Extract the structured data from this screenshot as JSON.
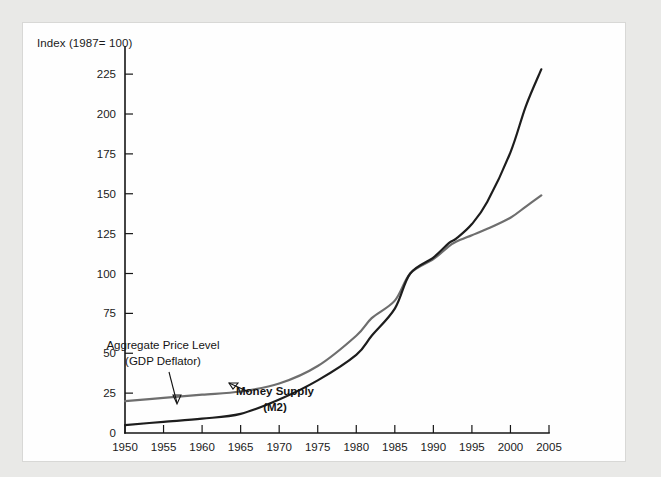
{
  "figure": {
    "title": "Index (1987= 100)",
    "panel_bg": "#fefefe",
    "outer_bg": "#e9e9e7"
  },
  "annotations": {
    "deflator": {
      "line1": "Aggregate Price Level",
      "line2": "(GDP Deflator)"
    },
    "money": {
      "line1": "Money Supply",
      "line2": "(M2)"
    }
  },
  "chart_data": {
    "type": "line",
    "title": "Index (1987= 100)",
    "xlabel": "",
    "ylabel": "Index (1987= 100)",
    "xlim": [
      1950,
      2005
    ],
    "ylim": [
      0,
      237
    ],
    "grid": false,
    "legend": "annotations-inline",
    "xticks": [
      1950,
      1955,
      1960,
      1965,
      1970,
      1975,
      1980,
      1985,
      1990,
      1995,
      2000,
      2005
    ],
    "yticks": [
      0,
      25,
      50,
      75,
      100,
      125,
      150,
      175,
      200,
      225
    ],
    "x": [
      1950,
      1955,
      1960,
      1965,
      1970,
      1975,
      1980,
      1982,
      1985,
      1987,
      1990,
      1992,
      1993,
      1995,
      1997,
      2000,
      2002,
      2004
    ],
    "series": [
      {
        "name": "Aggregate Price Level (GDP Deflator)",
        "color": "#6e6e6e",
        "width": 2.2,
        "values": [
          20,
          22,
          24,
          26,
          31,
          42,
          61,
          72,
          83,
          100,
          109,
          117,
          120,
          124,
          128,
          135,
          142,
          149
        ]
      },
      {
        "name": "Money Supply (M2)",
        "color": "#1d1d1d",
        "width": 2.2,
        "values": [
          5,
          7,
          9,
          12,
          21,
          33,
          49,
          61,
          78,
          100,
          110,
          119,
          122,
          131,
          145,
          176,
          205,
          228
        ]
      }
    ]
  }
}
